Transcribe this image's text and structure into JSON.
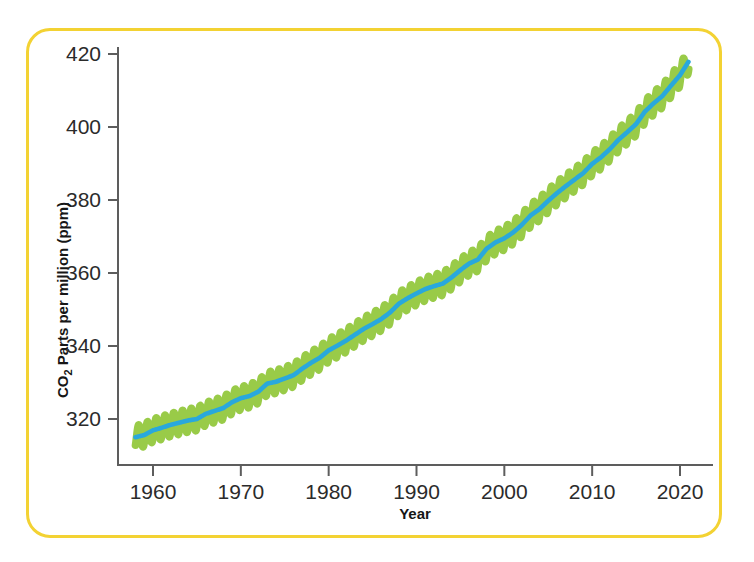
{
  "figure": {
    "border_color": "#f3d233",
    "background": "#ffffff"
  },
  "axis": {
    "y_title_main": "Parts per million  (ppm)",
    "y_title_prefix": "CO",
    "y_title_subscript": "2",
    "x_title": "Year",
    "axis_color": "#5d5d5d"
  },
  "chart_data": {
    "type": "line",
    "title": "",
    "xlabel": "Year",
    "ylabel": "CO2 Parts per million (ppm)",
    "xlim": [
      1957.5,
      2022.0
    ],
    "ylim": [
      311.0,
      422.0
    ],
    "grid": false,
    "legend": null,
    "xticks": [
      1960,
      1970,
      1980,
      1990,
      2000,
      2010,
      2020
    ],
    "yticks": [
      320,
      340,
      360,
      380,
      400,
      420
    ],
    "series": [
      {
        "name": "Monthly mean CO2 (seasonal cycle)",
        "color": "#93c83e",
        "style": "sawtooth-oscillation",
        "seasonal_amplitude_ppm": 3.2,
        "description": "Green monthly oscillation showing annual seasonal cycle around the trend"
      },
      {
        "name": "Smoothed annual trend",
        "color": "#29a8dc",
        "style": "line",
        "x": [
          1958,
          1959,
          1960,
          1961,
          1962,
          1963,
          1964,
          1965,
          1966,
          1967,
          1968,
          1969,
          1970,
          1971,
          1972,
          1973,
          1974,
          1975,
          1976,
          1977,
          1978,
          1979,
          1980,
          1981,
          1982,
          1983,
          1984,
          1985,
          1986,
          1987,
          1988,
          1989,
          1990,
          1991,
          1992,
          1993,
          1994,
          1995,
          1996,
          1997,
          1998,
          1999,
          2000,
          2001,
          2002,
          2003,
          2004,
          2005,
          2006,
          2007,
          2008,
          2009,
          2010,
          2011,
          2012,
          2013,
          2014,
          2015,
          2016,
          2017,
          2018,
          2019,
          2020,
          2021
        ],
        "values": [
          315.0,
          315.6,
          316.9,
          317.6,
          318.4,
          319.0,
          319.6,
          320.0,
          321.4,
          322.2,
          323.0,
          324.6,
          325.7,
          326.3,
          327.5,
          329.7,
          330.2,
          331.1,
          332.0,
          333.8,
          335.4,
          336.8,
          338.8,
          340.1,
          341.5,
          343.1,
          344.7,
          346.0,
          347.4,
          349.2,
          351.6,
          353.1,
          354.4,
          355.6,
          356.4,
          357.1,
          358.8,
          360.8,
          362.6,
          363.7,
          366.7,
          368.4,
          369.5,
          371.1,
          373.2,
          375.8,
          377.5,
          379.8,
          381.9,
          383.8,
          385.6,
          387.4,
          389.9,
          391.7,
          393.9,
          396.5,
          398.6,
          400.8,
          404.2,
          406.5,
          408.5,
          411.4,
          414.2,
          418.0
        ]
      }
    ]
  }
}
